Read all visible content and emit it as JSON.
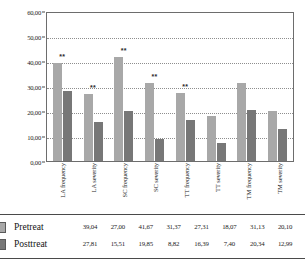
{
  "chart_data": {
    "type": "bar",
    "title": "",
    "xlabel": "",
    "ylabel": "",
    "ylim": [
      0,
      60
    ],
    "grid": true,
    "legend_position": "table-left",
    "categories": [
      "LA frequency",
      "LA severity",
      "SC frequency",
      "SC severity",
      "TT frequency",
      "TT severity",
      "TM frequency",
      "TM severity"
    ],
    "yticks": [
      "0,00",
      "10,00",
      "20,00",
      "30,00",
      "40,00",
      "50,00",
      "60,00"
    ],
    "ytick_values": [
      0,
      10,
      20,
      30,
      40,
      50,
      60
    ],
    "series": [
      {
        "name": "Pretreat",
        "color": "#a8a8a8",
        "values": [
          39.04,
          27.0,
          41.67,
          31.37,
          27.31,
          18.07,
          31.13,
          20.1
        ],
        "labels": [
          "39,04",
          "27,00",
          "41,67",
          "31,37",
          "27,31",
          "18,07",
          "31,13",
          "20,10"
        ]
      },
      {
        "name": "Posttreat",
        "color": "#777777",
        "values": [
          27.81,
          15.51,
          19.85,
          8.82,
          16.39,
          7.4,
          20.34,
          12.99
        ],
        "labels": [
          "27,81",
          "15,51",
          "19,85",
          "8,82",
          "16,39",
          "7,40",
          "20,34",
          "12,99"
        ]
      }
    ],
    "annotations": [
      {
        "category": "LA frequency",
        "text": "**"
      },
      {
        "category": "LA severity",
        "text": "**"
      },
      {
        "category": "SC frequency",
        "text": "**"
      },
      {
        "category": "SC severity",
        "text": "**"
      },
      {
        "category": "TT frequency",
        "text": "**"
      }
    ]
  },
  "table": {
    "rows": [
      {
        "label": "Pretreat",
        "values": [
          "39,04",
          "27,00",
          "41,67",
          "31,37",
          "27,31",
          "18,07",
          "31,13",
          "20,10"
        ]
      },
      {
        "label": "Posttreat",
        "values": [
          "27,81",
          "15,51",
          "19,85",
          "8,82",
          "16,39",
          "7,40",
          "20,34",
          "12,99"
        ]
      }
    ]
  }
}
